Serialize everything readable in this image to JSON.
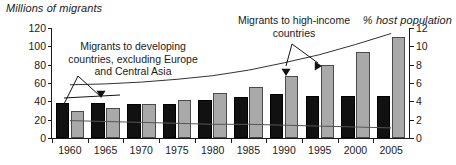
{
  "chart_data": {
    "type": "bar",
    "title": "",
    "ylabel": "Millions of migrants",
    "y2label": "% host population",
    "xlabel": "",
    "categories": [
      "1960",
      "1965",
      "1970",
      "1975",
      "1980",
      "1985",
      "1990",
      "1995",
      "2000",
      "2005"
    ],
    "ylim": [
      0,
      120
    ],
    "y2lim": [
      0,
      12
    ],
    "yticks": [
      "0",
      "20",
      "40",
      "60",
      "80",
      "100",
      "120"
    ],
    "y2ticks": [
      "0",
      "2",
      "4",
      "6",
      "8",
      "10",
      "12"
    ],
    "grid": false,
    "legend": "annotations",
    "series": [
      {
        "name": "Migrants to developing countries, excluding Europe and Central Asia",
        "kind": "bar",
        "color": "#111111",
        "axis": "left",
        "values": [
          38,
          38,
          37,
          37,
          41,
          45,
          48,
          46,
          46,
          46
        ]
      },
      {
        "name": "Migrants to high-income countries",
        "kind": "bar",
        "color": "#a9a9a9",
        "axis": "left",
        "values": [
          30,
          33,
          37,
          42,
          49,
          56,
          68,
          80,
          94,
          110
        ]
      },
      {
        "name": "% host population (high-income)",
        "kind": "line",
        "color": "#333333",
        "axis": "right",
        "values": [
          5.8,
          5.9,
          6.1,
          6.4,
          6.8,
          7.4,
          8.2,
          9.1,
          10.2,
          11.4
        ]
      },
      {
        "name": "% host population (developing)",
        "kind": "line",
        "color": "#555555",
        "axis": "right",
        "values": [
          1.9,
          1.8,
          1.7,
          1.6,
          1.5,
          1.5,
          1.4,
          1.3,
          1.2,
          1.1
        ]
      }
    ],
    "annotations": [
      {
        "name": "developing-callout",
        "text": "Migrants to developing\ncountries, excluding Europe\nand Central Asia"
      },
      {
        "name": "high-income-callout",
        "text": "Migrants to high-income\ncountries"
      }
    ]
  },
  "labels": {
    "left_axis_title": "Millions of migrants",
    "right_axis_title": "% host population",
    "callout_developing": "Migrants to developing\ncountries, excluding Europe\nand Central Asia",
    "callout_high_income": "Migrants to high-income\ncountries"
  }
}
